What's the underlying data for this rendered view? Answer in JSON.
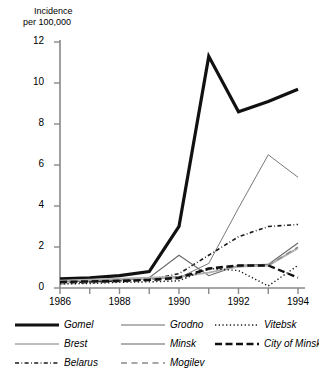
{
  "axes": {
    "y_title_line1": "Incidence",
    "y_title_line2": "per 100,000",
    "y_ticks": [
      "12",
      "10",
      "8",
      "6",
      "4",
      "2",
      "0"
    ],
    "x_ticks": [
      "1986",
      "1988",
      "1990",
      "1992",
      "1994"
    ]
  },
  "legend": {
    "items": [
      {
        "label": "Gomel",
        "style": "thick-solid-black",
        "color": "#111111",
        "col": 1,
        "row": 1
      },
      {
        "label": "Brest",
        "style": "thin-solid-gray",
        "color": "#7a7a7a",
        "col": 1,
        "row": 2
      },
      {
        "label": "Belarus",
        "style": "dash-dot-black",
        "color": "#1a1a1a",
        "col": 1,
        "row": 3
      },
      {
        "label": "Grodno",
        "style": "medium-solid-gray",
        "color": "#6b6b6b",
        "col": 2,
        "row": 1
      },
      {
        "label": "Minsk",
        "style": "light-solid-gray",
        "color": "#b0b0b0",
        "col": 2,
        "row": 2
      },
      {
        "label": "Mogilev",
        "style": "long-dash-gray",
        "color": "#8a8a8a",
        "col": 2,
        "row": 3
      },
      {
        "label": "Vitebsk",
        "style": "fine-dotted-black",
        "color": "#1a1a1a",
        "col": 3,
        "row": 1
      },
      {
        "label": "City of Minsk",
        "style": "thick-dashed-black",
        "color": "#111111",
        "col": 3,
        "row": 2
      }
    ]
  },
  "chart_data": {
    "type": "line",
    "title": "",
    "xlabel": "",
    "ylabel": "Incidence per 100,000",
    "x": [
      1986,
      1987,
      1988,
      1989,
      1990,
      1991,
      1992,
      1993,
      1994
    ],
    "xlim": [
      1986,
      1994
    ],
    "ylim": [
      0,
      12
    ],
    "ytick_values": [
      0,
      2,
      4,
      6,
      8,
      10,
      12
    ],
    "xtick_values": [
      1986,
      1988,
      1990,
      1992,
      1994
    ],
    "grid": false,
    "legend_position": "below",
    "series": [
      {
        "name": "Gomel",
        "color": "#111111",
        "width": 3.2,
        "dash": "none",
        "values": [
          0.45,
          0.5,
          0.6,
          0.8,
          3.0,
          11.3,
          8.6,
          9.1,
          9.7
        ]
      },
      {
        "name": "Brest",
        "color": "#7a7a7a",
        "width": 1.0,
        "dash": "none",
        "values": [
          0.3,
          0.35,
          0.4,
          0.45,
          0.5,
          1.2,
          3.9,
          6.5,
          5.4
        ]
      },
      {
        "name": "Belarus",
        "color": "#1a1a1a",
        "width": 1.6,
        "dash": "dash-dot",
        "values": [
          0.25,
          0.3,
          0.35,
          0.4,
          0.7,
          1.6,
          2.5,
          3.0,
          3.1
        ]
      },
      {
        "name": "Grodno",
        "color": "#6b6b6b",
        "width": 1.2,
        "dash": "none",
        "values": [
          0.3,
          0.35,
          0.4,
          0.5,
          1.6,
          0.6,
          1.1,
          1.15,
          2.2
        ]
      },
      {
        "name": "Minsk",
        "color": "#b0b0b0",
        "width": 2.0,
        "dash": "none",
        "values": [
          0.35,
          0.4,
          0.45,
          0.5,
          0.55,
          0.75,
          1.05,
          1.1,
          1.95
        ]
      },
      {
        "name": "Mogilev",
        "color": "#8a8a8a",
        "width": 1.4,
        "dash": "long-dash",
        "values": [
          0.2,
          0.25,
          0.3,
          0.35,
          0.45,
          0.9,
          1.05,
          1.1,
          2.0
        ]
      },
      {
        "name": "Vitebsk",
        "color": "#1a1a1a",
        "width": 1.4,
        "dash": "fine-dot",
        "values": [
          0.2,
          0.22,
          0.28,
          0.3,
          0.35,
          0.95,
          0.85,
          0.1,
          1.1
        ]
      },
      {
        "name": "City of Minsk",
        "color": "#111111",
        "width": 2.4,
        "dash": "thick-dash",
        "values": [
          0.3,
          0.32,
          0.35,
          0.4,
          0.5,
          0.95,
          1.1,
          1.1,
          0.5
        ]
      }
    ]
  }
}
